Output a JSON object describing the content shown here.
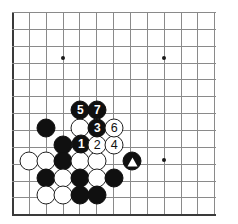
{
  "diagram": {
    "kind": "go-board-diagram",
    "board_size": 19,
    "visible_columns": 13,
    "visible_rows": 13,
    "grid": {
      "origin_x": 12,
      "origin_y": 12,
      "spacing": 16.85,
      "cols": 13,
      "rows": 13,
      "line_color": "#8a8a8a",
      "edge_color": "#3a3a3a",
      "background": "#ffffff"
    },
    "star_points": [
      {
        "x": 63,
        "y": 58
      },
      {
        "x": 164,
        "y": 58
      },
      {
        "x": 164,
        "y": 160
      }
    ],
    "colors": {
      "black_stone": "#101010",
      "white_stone": "#ffffff",
      "white_stone_border": "#202020",
      "black_label": "#ffffff",
      "white_label": "#101010"
    },
    "move_sequence": [
      {
        "number": "1",
        "color": "black",
        "x": 81,
        "y": 144
      },
      {
        "number": "2",
        "color": "white",
        "x": 97,
        "y": 145
      },
      {
        "number": "3",
        "color": "black",
        "x": 97,
        "y": 128
      },
      {
        "number": "4",
        "color": "white",
        "x": 114,
        "y": 145
      },
      {
        "number": "5",
        "color": "black",
        "x": 80,
        "y": 110
      },
      {
        "number": "6",
        "color": "white",
        "x": 114,
        "y": 128
      },
      {
        "number": "7",
        "color": "black",
        "x": 97,
        "y": 110
      }
    ],
    "marked_stones": [
      {
        "mark": "triangle",
        "color": "black",
        "x": 132,
        "y": 161
      }
    ],
    "plain_stones": [
      {
        "color": "black",
        "x": 46,
        "y": 128
      },
      {
        "color": "white",
        "x": 80,
        "y": 128
      },
      {
        "color": "black",
        "x": 63,
        "y": 145
      },
      {
        "color": "white",
        "x": 29,
        "y": 161
      },
      {
        "color": "white",
        "x": 46,
        "y": 161
      },
      {
        "color": "black",
        "x": 63,
        "y": 161
      },
      {
        "color": "white",
        "x": 80,
        "y": 161
      },
      {
        "color": "white",
        "x": 97,
        "y": 161
      },
      {
        "color": "black",
        "x": 46,
        "y": 178
      },
      {
        "color": "white",
        "x": 63,
        "y": 178
      },
      {
        "color": "black",
        "x": 80,
        "y": 178
      },
      {
        "color": "white",
        "x": 97,
        "y": 178
      },
      {
        "color": "black",
        "x": 114,
        "y": 178
      },
      {
        "color": "white",
        "x": 46,
        "y": 195
      },
      {
        "color": "white",
        "x": 63,
        "y": 195
      },
      {
        "color": "black",
        "x": 80,
        "y": 195
      },
      {
        "color": "black",
        "x": 97,
        "y": 195
      }
    ]
  }
}
